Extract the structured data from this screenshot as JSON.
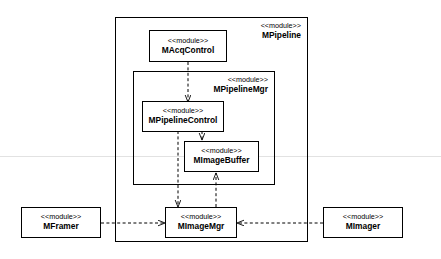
{
  "diagram": {
    "title": "",
    "stereotype": "<<module>>",
    "packages": [
      {
        "id": "mpipeline",
        "stereotype": "<<module>>",
        "name": "MPipeline"
      },
      {
        "id": "mpipelinemgr",
        "stereotype": "<<module>>",
        "name": "MPipelineMgr"
      }
    ],
    "modules": [
      {
        "id": "macqcontrol",
        "stereotype": "<<module>>",
        "name": "MAcqControl"
      },
      {
        "id": "mpipelinecontrol",
        "stereotype": "<<module>>",
        "name": "MPipelineControl"
      },
      {
        "id": "mimagebuffer",
        "stereotype": "<<module>>",
        "name": "MImageBuffer"
      },
      {
        "id": "mimagemgr",
        "stereotype": "<<module>>",
        "name": "MImageMgr"
      },
      {
        "id": "mframer",
        "stereotype": "<<module>>",
        "name": "MFramer"
      },
      {
        "id": "mimager",
        "stereotype": "<<module>>",
        "name": "MImager"
      }
    ],
    "connections": [
      {
        "from": "macqcontrol",
        "to": "mpipelinecontrol",
        "style": "dashed-arrow"
      },
      {
        "from": "mpipelinecontrol",
        "to": "mimagebuffer",
        "style": "dashed-arrow"
      },
      {
        "from": "mimagebuffer",
        "to": "mimagemgr",
        "style": "dashed-arrow"
      },
      {
        "from": "mpipelinecontrol",
        "to": "mimagemgr",
        "style": "dashed-arrow"
      },
      {
        "from": "mframer",
        "to": "mimagemgr",
        "style": "dashed-arrow"
      },
      {
        "from": "mimager",
        "to": "mimagemgr",
        "style": "dashed-arrow"
      }
    ]
  }
}
